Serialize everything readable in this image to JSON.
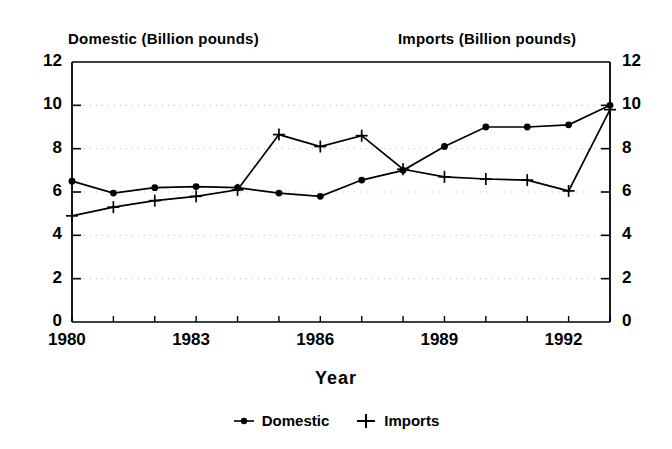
{
  "chart_data": {
    "type": "line",
    "title": "",
    "left_axis_title": "Domestic (Billion pounds)",
    "right_axis_title": "Imports (Billion pounds)",
    "xlabel": "Year",
    "ylabel": "",
    "ylim": [
      0,
      12
    ],
    "yticks": [
      0,
      2,
      4,
      6,
      8,
      10,
      12
    ],
    "right_ylim": [
      0,
      12
    ],
    "right_yticks": [
      0,
      2,
      4,
      6,
      8,
      10,
      12
    ],
    "xlim": [
      1980,
      1993
    ],
    "x": [
      1980,
      1981,
      1982,
      1983,
      1984,
      1985,
      1986,
      1987,
      1988,
      1989,
      1990,
      1991,
      1992,
      1993
    ],
    "xticks_labeled": [
      "1980",
      "1983",
      "1986",
      "1989",
      "1992"
    ],
    "xticks_labeled_values": [
      1980,
      1983,
      1986,
      1989,
      1992
    ],
    "grid": true,
    "grid_style": "dotted-horizontal",
    "legend_position": "bottom-center",
    "series": [
      {
        "name": "Domestic",
        "marker": "dot",
        "values": [
          6.5,
          5.95,
          6.2,
          6.25,
          6.2,
          5.95,
          5.8,
          6.55,
          7.0,
          8.1,
          9.0,
          9.0,
          9.1,
          10.0
        ]
      },
      {
        "name": "Imports",
        "marker": "plus",
        "values": [
          4.9,
          5.3,
          5.6,
          5.8,
          6.1,
          8.65,
          8.1,
          8.6,
          7.05,
          6.7,
          6.6,
          6.55,
          6.05,
          9.8
        ]
      }
    ]
  },
  "legend": {
    "items": [
      {
        "label": "Domestic",
        "marker": "dot"
      },
      {
        "label": "Imports",
        "marker": "plus"
      }
    ]
  },
  "colors": {
    "line": "#000000",
    "grid": "#b9b9b9",
    "background": "#ffffff"
  }
}
